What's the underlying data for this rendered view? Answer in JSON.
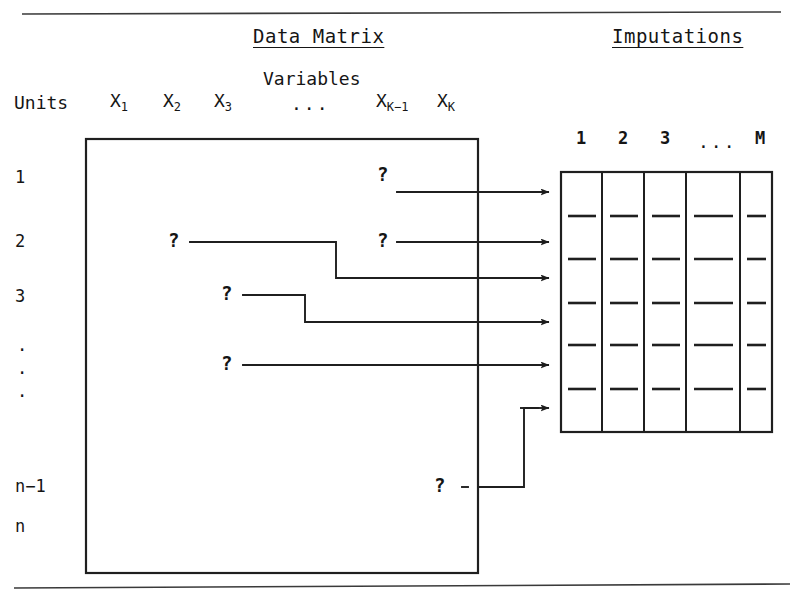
{
  "figure": {
    "panels": {
      "data_matrix_title": "Data Matrix",
      "imputations_title": "Imputations"
    },
    "axis_labels": {
      "units_label": "Units",
      "variables_label": "Variables"
    },
    "variables": [
      {
        "base": "X",
        "sub": "1"
      },
      {
        "base": "X",
        "sub": "2"
      },
      {
        "base": "X",
        "sub": "3"
      },
      {
        "base": "...",
        "sub": ""
      },
      {
        "base": "X",
        "sub": "K−1"
      },
      {
        "base": "X",
        "sub": "K"
      }
    ],
    "units": [
      "1",
      "2",
      "3",
      ".",
      ".",
      ".",
      "n−1",
      "n"
    ],
    "imputation_columns": [
      "1",
      "2",
      "3",
      "...",
      "M"
    ],
    "missing_marker": "?",
    "missing_cells": [
      {
        "unit": "1",
        "variable": "X_K-1"
      },
      {
        "unit": "2",
        "variable": "X_2"
      },
      {
        "unit": "2",
        "variable": "X_K-1"
      },
      {
        "unit": "3",
        "variable": "X_3"
      },
      {
        "unit": ".",
        "variable": "X_3"
      },
      {
        "unit": "n−1",
        "variable": "X_K-1"
      }
    ],
    "arrow_count": 6,
    "imputation_grid": {
      "columns": 5,
      "rows": 5
    },
    "colors": {
      "ink": "#151515",
      "line": "#2b2b2b",
      "background": "#ffffff"
    }
  }
}
